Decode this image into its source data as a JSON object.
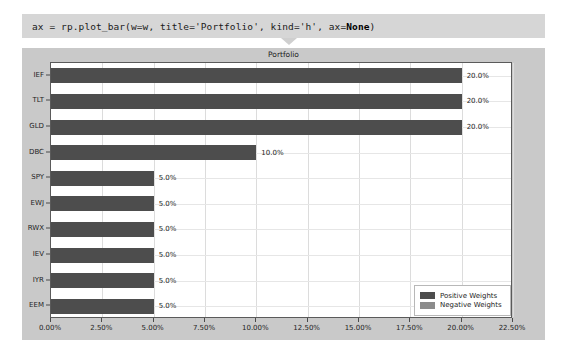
{
  "notebook": {
    "code_cell": {
      "prefix": "ax = rp.plot_bar(w=w, title='Portfolio', kind='h', ax=",
      "bold_arg": "None",
      "suffix": ")",
      "full_text": "ax = rp.plot_bar(w=w, title='Portfolio', kind='h', ax=None)"
    }
  },
  "chart_data": {
    "type": "bar",
    "orientation": "horizontal",
    "title": "Portfolio",
    "xlabel": "",
    "ylabel": "",
    "categories": [
      "EEM",
      "IYR",
      "IEV",
      "RWX",
      "EWJ",
      "SPY",
      "DBC",
      "GLD",
      "TLT",
      "IEF"
    ],
    "categories_top_to_bottom": [
      "IEF",
      "TLT",
      "GLD",
      "DBC",
      "SPY",
      "EWJ",
      "RWX",
      "IEV",
      "IYR",
      "EEM"
    ],
    "values": [
      5.0,
      5.0,
      5.0,
      5.0,
      5.0,
      5.0,
      10.0,
      20.0,
      20.0,
      20.0
    ],
    "values_top_to_bottom": [
      20.0,
      20.0,
      20.0,
      10.0,
      5.0,
      5.0,
      5.0,
      5.0,
      5.0,
      5.0
    ],
    "data_labels_top_to_bottom": [
      "20.0%",
      "20.0%",
      "20.0%",
      "10.0%",
      "5.0%",
      "5.0%",
      "5.0%",
      "5.0%",
      "5.0%",
      "5.0%"
    ],
    "xlim": [
      0.0,
      22.5
    ],
    "xticks": [
      0.0,
      2.5,
      5.0,
      7.5,
      10.0,
      12.5,
      15.0,
      17.5,
      20.0,
      22.5
    ],
    "xtick_labels": [
      "0.00%",
      "2.50%",
      "5.00%",
      "7.50%",
      "10.00%",
      "12.50%",
      "15.00%",
      "17.50%",
      "20.00%",
      "22.50%"
    ],
    "grid": true,
    "legend": {
      "position": "lower right",
      "entries": [
        {
          "label": "Positive Weights",
          "color": "#4d4d4d"
        },
        {
          "label": "Negative Weights",
          "color": "#8c8c8c"
        }
      ]
    },
    "colors": {
      "bar": "#4d4d4d",
      "negative_bar": "#8c8c8c",
      "axes_background": "#ffffff",
      "figure_background": "#c9c9c9",
      "grid": "#dcdcdc",
      "cell_background": "#d6d6d6"
    }
  }
}
